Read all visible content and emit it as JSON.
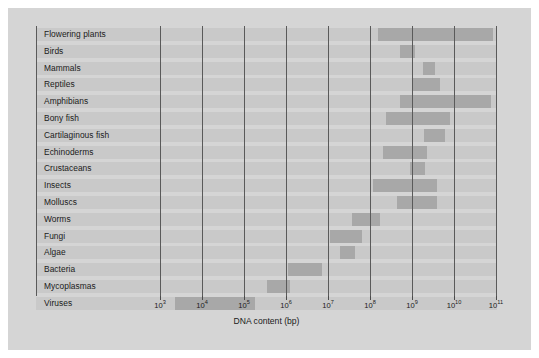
{
  "chart_data": {
    "type": "bar",
    "orientation": "horizontal",
    "title": "",
    "xlabel": "DNA content (bp)",
    "ylabel": "",
    "xscale": "log",
    "xlim": [
      1000,
      100000000000
    ],
    "grid": true,
    "legend": "none",
    "xticks": [
      {
        "label": "10",
        "exponent": "3",
        "value": 1000
      },
      {
        "label": "10",
        "exponent": "4",
        "value": 10000
      },
      {
        "label": "10",
        "exponent": "5",
        "value": 100000
      },
      {
        "label": "10",
        "exponent": "6",
        "value": 1000000
      },
      {
        "label": "10",
        "exponent": "7",
        "value": 10000000
      },
      {
        "label": "10",
        "exponent": "8",
        "value": 100000000
      },
      {
        "label": "10",
        "exponent": "9",
        "value": 1000000000
      },
      {
        "label": "10",
        "exponent": "10",
        "value": 10000000000
      },
      {
        "label": "10",
        "exponent": "11",
        "value": 100000000000
      }
    ],
    "categories": [
      "Flowering plants",
      "Birds",
      "Mammals",
      "Reptiles",
      "Amphibians",
      "Bony fish",
      "Cartilaginous fish",
      "Echinoderms",
      "Crustaceans",
      "Insects",
      "Molluscs",
      "Worms",
      "Fungi",
      "Algae",
      "Bacteria",
      "Mycoplasmas",
      "Viruses"
    ],
    "ranges": [
      {
        "category": "Flowering plants",
        "min_exp": 8.19,
        "max_exp": 10.93
      },
      {
        "category": "Birds",
        "min_exp": 8.71,
        "max_exp": 9.07
      },
      {
        "category": "Mammals",
        "min_exp": 9.26,
        "max_exp": 9.55
      },
      {
        "category": "Reptiles",
        "min_exp": 9.02,
        "max_exp": 9.67
      },
      {
        "category": "Amphibians",
        "min_exp": 8.71,
        "max_exp": 10.88
      },
      {
        "category": "Bony fish",
        "min_exp": 8.38,
        "max_exp": 9.9
      },
      {
        "category": "Cartilaginous fish",
        "min_exp": 9.29,
        "max_exp": 9.79
      },
      {
        "category": "Echinoderms",
        "min_exp": 8.31,
        "max_exp": 9.36
      },
      {
        "category": "Crustaceans",
        "min_exp": 8.95,
        "max_exp": 9.31
      },
      {
        "category": "Insects",
        "min_exp": 8.07,
        "max_exp": 9.6
      },
      {
        "category": "Molluscs",
        "min_exp": 8.64,
        "max_exp": 9.6
      },
      {
        "category": "Worms",
        "min_exp": 7.57,
        "max_exp": 8.24
      },
      {
        "category": "Fungi",
        "min_exp": 7.05,
        "max_exp": 7.81
      },
      {
        "category": "Algae",
        "min_exp": 7.29,
        "max_exp": 7.64
      },
      {
        "category": "Bacteria",
        "min_exp": 6.05,
        "max_exp": 6.86
      },
      {
        "category": "Mycoplasmas",
        "min_exp": 5.55,
        "max_exp": 6.1
      },
      {
        "category": "Viruses",
        "min_exp": 3.36,
        "max_exp": 5.26
      }
    ]
  },
  "colors": {
    "figure_background": "#d5d5d5",
    "row_band": "#c9c9c9",
    "bar": "#a8a8a8",
    "gridline": "#5a5a5a",
    "text": "#1a1a1a",
    "page_background": "#ffffff"
  }
}
